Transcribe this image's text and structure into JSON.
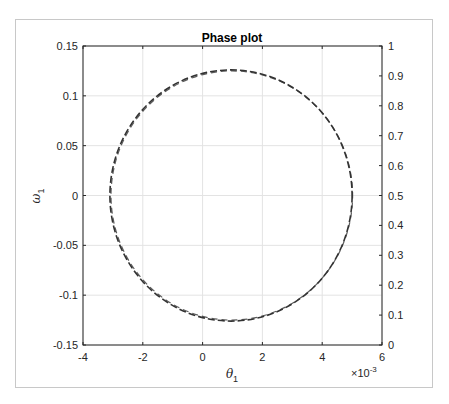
{
  "chart_data": {
    "type": "line",
    "title": "Phase plot",
    "xlabel": "θ",
    "xlabel_sub": "1",
    "ylabel": "ω",
    "ylabel_sub": "1",
    "x_exponent_label": "×10",
    "x_exponent": "-3",
    "xlim": [
      -4,
      6
    ],
    "ylim": [
      -0.15,
      0.15
    ],
    "y2lim": [
      0,
      1
    ],
    "grid": true,
    "x_ticks": [
      "-4",
      "-2",
      "0",
      "2",
      "4",
      "6"
    ],
    "y_ticks": [
      "0.15",
      "0.1",
      "0.05",
      "0",
      "-0.05",
      "-0.1",
      "-0.15"
    ],
    "y2_ticks": [
      "1",
      "0.9",
      "0.8",
      "0.7",
      "0.6",
      "0.5",
      "0.4",
      "0.3",
      "0.2",
      "0.1",
      "0"
    ],
    "series": [
      {
        "name": "trajectory",
        "style": "dashed",
        "color": "#333333",
        "shape": "ellipse",
        "center_x": 0.95,
        "center_y": 0.0,
        "radius_x": 4.05,
        "radius_y": 0.126,
        "note": "x in units of 1e-3; closed orbit from x≈-3.1e-3 to 5.0e-3, y from -0.126 to 0.126"
      }
    ]
  }
}
